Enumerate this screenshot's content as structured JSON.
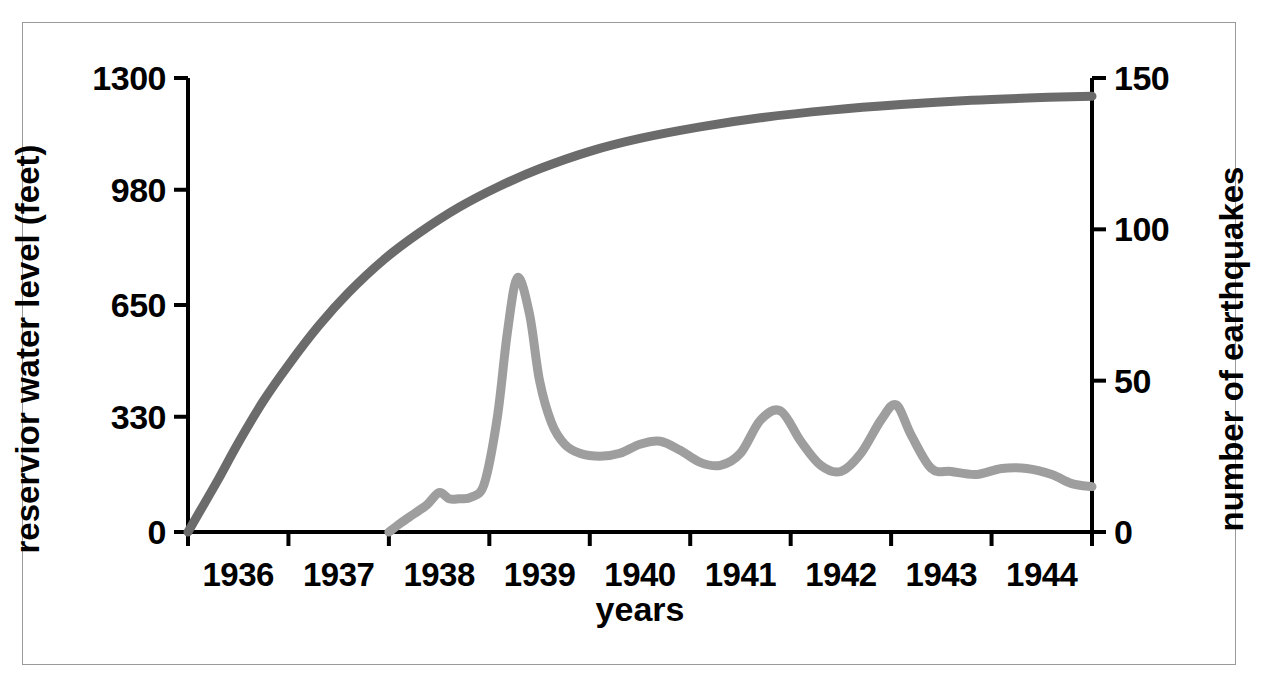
{
  "figure": {
    "background_color": "#ffffff",
    "frame_color": "#9a9a9a",
    "axis_color": "#000000"
  },
  "chart_data": {
    "type": "line",
    "title": "",
    "xlabel": "years",
    "ylabel": "reservior water level (feet)",
    "y2label": "number of earthquakes",
    "grid": false,
    "legend": "none",
    "xlim": [
      1935.5,
      1944.5
    ],
    "xticks": [
      1935.5,
      1936.5,
      1937.5,
      1938.5,
      1939.5,
      1940.5,
      1941.5,
      1942.5,
      1943.5,
      1944.5
    ],
    "xtick_labels": [
      "1936",
      "1937",
      "1938",
      "1939",
      "1940",
      "1941",
      "1942",
      "1943",
      "1944"
    ],
    "ylim": [
      0,
      1300
    ],
    "yticks": [
      0,
      330,
      650,
      980,
      1300
    ],
    "ytick_labels": [
      "0",
      "330",
      "650",
      "980",
      "1300"
    ],
    "y2lim": [
      0,
      150
    ],
    "y2ticks": [
      0,
      50,
      100,
      150
    ],
    "y2tick_labels": [
      "0",
      "50",
      "100",
      "150"
    ],
    "series": [
      {
        "name": "reservior water level (feet)",
        "axis": "left",
        "color": "#6b6b6b",
        "linewidth": 9,
        "x": [
          1935.5,
          1935.62,
          1935.8,
          1936.0,
          1936.25,
          1936.5,
          1936.8,
          1937.1,
          1937.45,
          1937.8,
          1938.2,
          1938.6,
          1939.0,
          1939.5,
          1940.0,
          1940.6,
          1941.2,
          1941.9,
          1942.6,
          1943.3,
          1944.0,
          1944.5
        ],
        "values": [
          0,
          60,
          150,
          255,
          375,
          478,
          590,
          686,
          780,
          856,
          930,
          990,
          1040,
          1090,
          1127,
          1160,
          1186,
          1208,
          1224,
          1236,
          1244,
          1248
        ]
      },
      {
        "name": "number of earthquakes",
        "axis": "right",
        "color": "#9e9e9e",
        "linewidth": 9,
        "x": [
          1937.5,
          1937.62,
          1937.75,
          1937.88,
          1938.0,
          1938.1,
          1938.2,
          1938.32,
          1938.45,
          1938.58,
          1938.68,
          1938.78,
          1938.9,
          1939.0,
          1939.12,
          1939.25,
          1939.4,
          1939.6,
          1939.8,
          1940.0,
          1940.2,
          1940.4,
          1940.6,
          1940.8,
          1941.0,
          1941.2,
          1941.4,
          1941.6,
          1941.8,
          1942.0,
          1942.2,
          1942.4,
          1942.55,
          1942.7,
          1942.9,
          1943.1,
          1943.35,
          1943.6,
          1943.85,
          1944.1,
          1944.3,
          1944.5
        ],
        "values": [
          0,
          3,
          6,
          9,
          13,
          11,
          11,
          11.5,
          16,
          38,
          66,
          84,
          72,
          50,
          36,
          29,
          26,
          25,
          26,
          29,
          30,
          27,
          23,
          22,
          26,
          37,
          40,
          30,
          22,
          20,
          26,
          37,
          42,
          32,
          21,
          20,
          19,
          21,
          21,
          19,
          16,
          15
        ]
      }
    ]
  }
}
